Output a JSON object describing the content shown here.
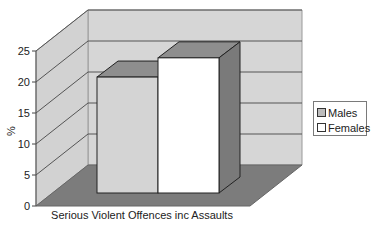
{
  "chart_data": {
    "type": "bar",
    "title": "",
    "xlabel": "Serious Violent Offences inc Assaults",
    "ylabel": "%",
    "categories": [
      "Serious Violent Offences inc Assaults"
    ],
    "series": [
      {
        "name": "Males",
        "values": [
          18.7
        ],
        "color": "#d4d4d4"
      },
      {
        "name": "Females",
        "values": [
          21.8
        ],
        "color": "#ffffff"
      }
    ],
    "ylim": [
      0,
      25
    ],
    "yticks": [
      0,
      5,
      10,
      15,
      20,
      25
    ],
    "grid": true,
    "three_d": true,
    "legend_position": "right"
  },
  "colors": {
    "wall": "#d6d6d6",
    "floor": "#7c7c7c",
    "bar_top": "#8e8e8e",
    "bar_side": "#7a7a7a",
    "grid_line": "#555555"
  }
}
